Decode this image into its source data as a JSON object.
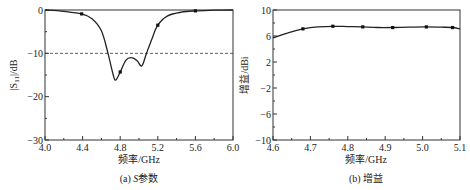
{
  "chart_data": [
    {
      "type": "line",
      "caption": "(a) S参数",
      "caption_prefix": "(a) ",
      "caption_italic": "S",
      "caption_suffix": "参数",
      "title": "",
      "xlabel": "频率/GHz",
      "ylabel": "|S11|/dB",
      "xlim": [
        4.0,
        6.0
      ],
      "ylim": [
        -30,
        0
      ],
      "xticks": [
        "4.0",
        "4.4",
        "4.8",
        "5.2",
        "5.6",
        "6.0"
      ],
      "yticks": [
        "0",
        "-10",
        "-20",
        "-30"
      ],
      "grid": false,
      "reference_line": {
        "y": -10,
        "style": "dashed"
      },
      "series": [
        {
          "name": "|S11|",
          "x": [
            4.0,
            4.2,
            4.39,
            4.5,
            4.6,
            4.67,
            4.72,
            4.75,
            4.8,
            4.86,
            4.92,
            4.98,
            5.03,
            5.08,
            5.14,
            5.2,
            5.3,
            5.45,
            5.6,
            5.8,
            6.0
          ],
          "values": [
            0,
            -0.3,
            -0.9,
            -2.0,
            -4.8,
            -10,
            -14.5,
            -16.2,
            -14.3,
            -11.6,
            -11.0,
            -11.7,
            -12.9,
            -10,
            -6.5,
            -3.5,
            -1.4,
            -0.5,
            -0.2,
            -0.05,
            0
          ],
          "markers_x": [
            4.39,
            4.8,
            5.2,
            5.6
          ],
          "markers_y": [
            -0.9,
            -14.3,
            -3.5,
            -0.2
          ]
        }
      ]
    },
    {
      "type": "line",
      "caption": "(b) 增益",
      "title": "",
      "xlabel": "频率/GHz",
      "ylabel": "增益/dBi",
      "xlim": [
        4.6,
        5.1
      ],
      "ylim": [
        -10,
        10
      ],
      "xticks": [
        "4.6",
        "4.7",
        "4.8",
        "4.9",
        "5.0",
        "5.1"
      ],
      "yticks": [
        "10",
        "6",
        "2",
        "-2",
        "-6",
        "-10"
      ],
      "grid": false,
      "series": [
        {
          "name": "增益",
          "x": [
            4.6,
            4.64,
            4.68,
            4.72,
            4.76,
            4.8,
            4.84,
            4.88,
            4.92,
            4.96,
            5.01,
            5.05,
            5.08,
            5.1
          ],
          "values": [
            5.7,
            6.5,
            7.1,
            7.4,
            7.5,
            7.45,
            7.4,
            7.3,
            7.3,
            7.35,
            7.4,
            7.35,
            7.3,
            7.1
          ],
          "markers_x": [
            4.68,
            4.76,
            4.84,
            4.92,
            5.01,
            5.08
          ],
          "markers_y": [
            7.1,
            7.5,
            7.4,
            7.3,
            7.4,
            7.3
          ]
        }
      ]
    }
  ]
}
